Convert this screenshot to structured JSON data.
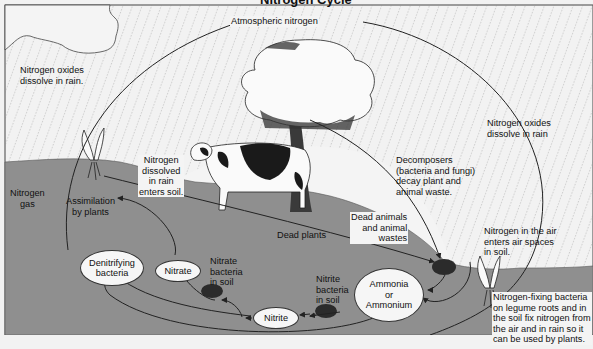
{
  "diagram": {
    "title_partial": "Nitrogen Cycle",
    "colors": {
      "sky": "#f2f2f2",
      "ground": "#8f8f8f",
      "rain": "#8a8a8a",
      "arrow": "#222222",
      "oval_fill": "#f6f6f6",
      "bacteria_blob": "#2b2b2b"
    },
    "labels": {
      "atmospheric_nitrogen": "Atmospheric nitrogen",
      "oxides_left": [
        "Nitrogen oxides",
        "dissolve in rain."
      ],
      "oxides_right": [
        "Nitrogen oxides",
        "dissolve in rain"
      ],
      "nitrogen_gas": [
        "Nitrogen",
        "gas"
      ],
      "assimilation": [
        "Assimilation",
        "by plants"
      ],
      "dissolved_rain": [
        "Nitrogen",
        "dissolved",
        "in rain",
        "enters soil."
      ],
      "decomposers": [
        "Decomposers",
        "(bacteria and fungi)",
        "decay plant and",
        "animal waste."
      ],
      "dead_animals": [
        "Dead animals",
        "and animal",
        "wastes"
      ],
      "dead_plants": "Dead plants",
      "nitrate_bacteria": [
        "Nitrate",
        "bacteria",
        "in soil"
      ],
      "nitrite_bacteria": [
        "Nitrite",
        "bacteria",
        "in soil"
      ],
      "air_spaces": [
        "Nitrogen in the air",
        "enters air spaces",
        "in soil."
      ],
      "fixing": [
        "Nitrogen-fixing bacteria",
        "on legume roots and in",
        "the soil fix nitrogen from",
        "the air and in rain so it",
        "can be used by plants."
      ]
    },
    "nodes": {
      "denitrifying": [
        "Denitrifying",
        "bacteria"
      ],
      "nitrate": "Nitrate",
      "nitrite": "Nitrite",
      "ammonia": [
        "Ammonia",
        "or",
        "Ammonium"
      ]
    }
  }
}
